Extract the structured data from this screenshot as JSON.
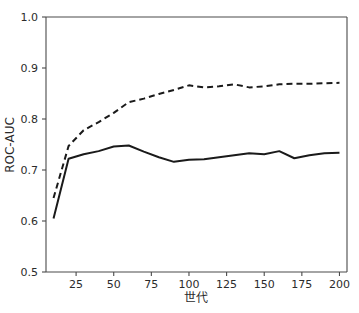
{
  "chart_data": {
    "type": "line",
    "title": "",
    "xlabel": "世代",
    "ylabel": "ROC-AUC",
    "xlim": [
      5,
      205
    ],
    "ylim": [
      0.5,
      1.0
    ],
    "grid": false,
    "legend": "none",
    "xticks": [
      25,
      50,
      75,
      100,
      125,
      150,
      175,
      200
    ],
    "xtick_labels": [
      "25",
      "50",
      "75",
      "100",
      "125",
      "150",
      "175",
      "200"
    ],
    "yticks": [
      0.5,
      0.6,
      0.7,
      0.8,
      0.9,
      1.0
    ],
    "ytick_labels": [
      "0.5",
      "0.6",
      "0.7",
      "0.8",
      "0.9",
      "1.0"
    ],
    "x": [
      10,
      20,
      30,
      40,
      50,
      60,
      70,
      80,
      90,
      100,
      110,
      120,
      130,
      140,
      150,
      160,
      170,
      180,
      190,
      200
    ],
    "series": [
      {
        "name": "solid-series",
        "style": "solid",
        "color": "#1a1a1a",
        "values": [
          0.605,
          0.722,
          0.731,
          0.737,
          0.746,
          0.748,
          0.736,
          0.725,
          0.716,
          0.72,
          0.721,
          0.725,
          0.729,
          0.733,
          0.731,
          0.737,
          0.723,
          0.729,
          0.733,
          0.734
        ]
      },
      {
        "name": "dashed-series",
        "style": "dashed",
        "color": "#1a1a1a",
        "values": [
          0.645,
          0.747,
          0.778,
          0.794,
          0.812,
          0.833,
          0.84,
          0.849,
          0.857,
          0.866,
          0.862,
          0.864,
          0.868,
          0.862,
          0.864,
          0.868,
          0.869,
          0.869,
          0.87,
          0.871
        ]
      }
    ]
  }
}
